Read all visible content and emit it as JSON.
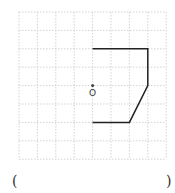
{
  "diagram": {
    "grid": {
      "cols": 8,
      "rows": 8,
      "origin_px": [
        19,
        12
      ],
      "cell_px": 18.4,
      "line_color": "#c8c8c8"
    },
    "shape": {
      "points": [
        [
          4,
          2
        ],
        [
          7,
          2
        ],
        [
          7,
          4
        ],
        [
          6,
          6
        ],
        [
          4,
          6
        ]
      ],
      "stroke_color": "#222222"
    },
    "center_point": {
      "label": "O",
      "position": [
        4,
        4
      ]
    }
  },
  "answer": {
    "open_paren": "(",
    "close_paren": ")"
  }
}
